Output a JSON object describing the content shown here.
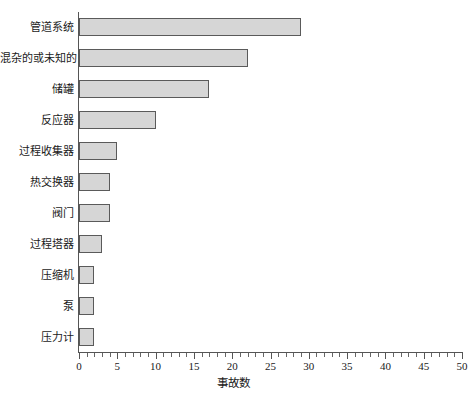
{
  "chart_data": {
    "type": "bar",
    "orientation": "horizontal",
    "title": "",
    "subtitle": "",
    "xlabel": "事故数",
    "ylabel": "",
    "categories": [
      "管道系统",
      "混杂的或未知的",
      "储罐",
      "反应器",
      "过程收集器",
      "热交换器",
      "阀门",
      "过程塔器",
      "压缩机",
      "泵",
      "压力计"
    ],
    "values": [
      29,
      22,
      17,
      10,
      5,
      4,
      4,
      3,
      2,
      2,
      2
    ],
    "xlim": [
      0,
      50
    ],
    "xticks": [
      0,
      5,
      10,
      15,
      20,
      25,
      30,
      35,
      40,
      45,
      50
    ],
    "xtick_labels": [
      "0",
      "5",
      "10",
      "15",
      "20",
      "25",
      "30",
      "35",
      "40",
      "45",
      "50"
    ],
    "x_minor_tick_interval": 1,
    "grid": false,
    "legend": null,
    "bar_fill_color": "#d6d6d6",
    "bar_edge_color": "#5a5a5a",
    "axis_color": "#555555",
    "background_color": "#ffffff"
  }
}
